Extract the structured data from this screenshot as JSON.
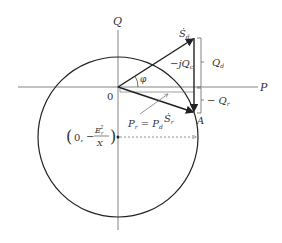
{
  "diagram": {
    "axes": {
      "q_label": "Q",
      "p_label": "P",
      "origin_label": "0"
    },
    "vectors": {
      "s_d_label": "Ṡ",
      "s_d_sub": "d",
      "s_r_label": "Ṡ",
      "s_r_sub": "r",
      "jq_label": "−jQ",
      "jq_sub": "c"
    },
    "angle_label": "φ",
    "point_a_label": "A",
    "braces": {
      "q_d_label": "Q",
      "q_d_sub": "d",
      "q_r_label": "− Q",
      "q_r_sub": "r"
    },
    "annotation": {
      "pr_label": "P",
      "pr_sub": "r",
      "eq": " = ",
      "pd_label": "P",
      "pd_sub": "d"
    },
    "center_point": {
      "open": "(",
      "zero": "0,",
      "minus": "−",
      "numerator": "E",
      "num_sub": "r",
      "num_sup": "2",
      "denominator": "X",
      "close": ")"
    },
    "colors": {
      "stroke": "#222222",
      "axis": "#555555",
      "dashed": "#777777"
    }
  }
}
